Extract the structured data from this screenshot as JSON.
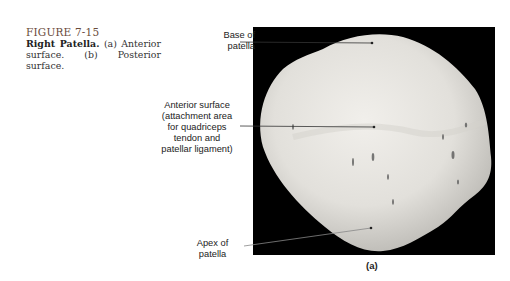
{
  "caption": {
    "figure_number": "FIGURE 7-15",
    "title": "Right Patella.",
    "text": " (a) Anterior surface. (b) Posterior surface."
  },
  "labels": {
    "base": [
      "Base of",
      "patella"
    ],
    "anterior": [
      "Anterior surface",
      "(attachment area",
      "for quadriceps",
      "tendon and",
      "patellar ligament)"
    ],
    "apex": [
      "Apex of",
      "patella"
    ]
  },
  "panel_label": "(a)",
  "colors": {
    "background": "#ffffff",
    "photo_background": "#000000",
    "bone": "#e6e4df",
    "figure_number": "#6a4b3a"
  }
}
